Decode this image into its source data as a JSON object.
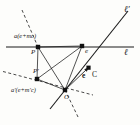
{
  "figure": {
    "kind": "geometric-diagram",
    "background_color": "#fdfdfb",
    "stroke_color": "#1a1a1a",
    "labels": {
      "line_l": "ℓ",
      "line_l_prime": "ℓ′",
      "point_P": "P",
      "point_P_prime": "P′",
      "point_e": "e",
      "point_O": "O",
      "vector_e": "e",
      "vector_C": "C",
      "formula_upper": "a(e+mc)",
      "formula_lower": "a′(e+m′c)"
    },
    "geometry": {
      "points": {
        "P": {
          "x": 38,
          "y": 47
        },
        "P_prime": {
          "x": 37,
          "y": 79
        },
        "e": {
          "x": 82,
          "y": 46
        },
        "O": {
          "x": 65,
          "y": 90
        },
        "C_tip": {
          "x": 88,
          "y": 68
        }
      },
      "solid_lines": [
        {
          "name": "line-l",
          "x1": 6,
          "y1": 47,
          "x2": 134,
          "y2": 47
        },
        {
          "name": "line-l-prime",
          "x1": 50,
          "y1": 108,
          "x2": 127,
          "y2": 12
        }
      ],
      "dashed_lines": [
        {
          "name": "dashed-through-P",
          "x1": 22,
          "y1": 10,
          "x2": 38,
          "y2": 47
        },
        {
          "name": "dashed-through-P-prime-O",
          "x1": 4,
          "y1": 72,
          "x2": 92,
          "y2": 95
        },
        {
          "name": "dashed-below-O",
          "x1": 65,
          "y1": 90,
          "x2": 78,
          "y2": 118
        }
      ],
      "segments": [
        {
          "name": "seg-P-O",
          "x1": 38,
          "y1": 47,
          "x2": 65,
          "y2": 90
        },
        {
          "name": "seg-P-e",
          "x1": 38,
          "y1": 47,
          "x2": 82,
          "y2": 46
        },
        {
          "name": "seg-e-O",
          "x1": 82,
          "y1": 46,
          "x2": 65,
          "y2": 90
        },
        {
          "name": "seg-Pprime-e",
          "x1": 37,
          "y1": 79,
          "x2": 82,
          "y2": 46
        },
        {
          "name": "seg-Pprime-O",
          "x1": 37,
          "y1": 79,
          "x2": 65,
          "y2": 90
        },
        {
          "name": "seg-P-Pprime",
          "x1": 38,
          "y1": 47,
          "x2": 37,
          "y2": 79
        }
      ],
      "vector_arrow": {
        "name": "vector-C",
        "x1": 65,
        "y1": 90,
        "x2": 88,
        "y2": 68
      }
    }
  }
}
